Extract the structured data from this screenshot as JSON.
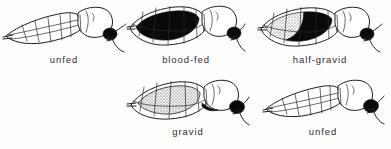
{
  "figure": {
    "background_color": "#fdfdfc",
    "ink_color": "#1d1d1d",
    "blood_color": "#0a0a0a",
    "egg_color": "#e8e8e6",
    "label_color": "#2e2e2e",
    "specimens": [
      {
        "id": "unfed-top",
        "label": "unfed",
        "row": "top",
        "column": 1,
        "abdomen_state": "empty",
        "abdomen_fill": "white",
        "description": "slender segmented abdomen, no contents"
      },
      {
        "id": "blood-fed",
        "label": "blood-fed",
        "row": "top",
        "column": 2,
        "abdomen_state": "blood",
        "abdomen_fill": "black",
        "description": "abdomen distended and filled with dark blood"
      },
      {
        "id": "half-gravid",
        "label": "half-gravid",
        "row": "top",
        "column": 3,
        "abdomen_state": "blood-and-eggs",
        "abdomen_fill": "black-and-stipple",
        "description": "anterior stippled eggs, posterior dark blood"
      },
      {
        "id": "gravid",
        "label": "gravid",
        "row": "bottom",
        "column": 2,
        "abdomen_state": "eggs",
        "abdomen_fill": "stipple",
        "description": "abdomen rounded and filled with stippled eggs"
      },
      {
        "id": "unfed-bottom",
        "label": "unfed",
        "row": "bottom",
        "column": 3,
        "abdomen_state": "empty",
        "abdomen_fill": "white",
        "description": "slender segmented abdomen, no contents"
      }
    ]
  }
}
